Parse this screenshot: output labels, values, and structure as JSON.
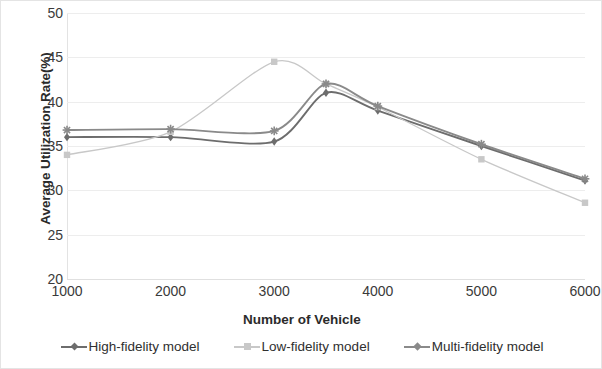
{
  "chart_data": {
    "type": "line",
    "title": "",
    "xlabel": "Number of Vehicle",
    "ylabel": "Average Utilization Rate(%)",
    "categories": [
      1000,
      2000,
      3000,
      4000,
      5000,
      6000
    ],
    "x": [
      1000,
      2000,
      3000,
      3500,
      4000,
      5000,
      6000
    ],
    "xlim": [
      1000,
      6000
    ],
    "ylim": [
      20,
      50
    ],
    "yticks": [
      20,
      25,
      30,
      35,
      40,
      45,
      50
    ],
    "xticks": [
      1000,
      2000,
      3000,
      4000,
      5000,
      6000
    ],
    "grid": true,
    "legend_position": "bottom",
    "series": [
      {
        "name": "High-fidelity model",
        "color": "#6d6d6d",
        "marker": "diamond",
        "x": [
          1000,
          2000,
          3000,
          3500,
          4000,
          5000,
          6000
        ],
        "values": [
          36.0,
          36.0,
          35.5,
          41.0,
          39.0,
          35.0,
          31.1
        ]
      },
      {
        "name": "Low-fidelity model",
        "color": "#c8c8c8",
        "marker": "square",
        "x": [
          1000,
          2000,
          3000,
          3500,
          4000,
          5000,
          6000
        ],
        "values": [
          34.0,
          36.6,
          44.5,
          42.0,
          39.4,
          33.5,
          28.6
        ]
      },
      {
        "name": "Multi-fidelity model",
        "color": "#8a8a8a",
        "marker": "cross",
        "x": [
          1000,
          2000,
          3000,
          3500,
          4000,
          5000,
          6000
        ],
        "values": [
          36.8,
          36.9,
          36.7,
          42.0,
          39.5,
          35.2,
          31.3
        ]
      }
    ]
  },
  "axes": {
    "y_title": "Average Utilization Rate(%)",
    "x_title": "Number of Vehicle",
    "y_ticks": [
      "50",
      "45",
      "40",
      "35",
      "30",
      "25",
      "20"
    ],
    "x_ticks": [
      "1000",
      "2000",
      "3000",
      "4000",
      "5000",
      "6000"
    ]
  },
  "legend": {
    "items": [
      {
        "label": "High-fidelity model",
        "color": "#6d6d6d"
      },
      {
        "label": "Low-fidelity model",
        "color": "#c8c8c8"
      },
      {
        "label": "Multi-fidelity model",
        "color": "#8a8a8a"
      }
    ]
  }
}
